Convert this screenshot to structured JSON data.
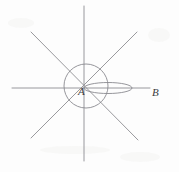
{
  "figure": {
    "background_color": "#fdfdfd",
    "line_color": "#8d8d92",
    "label_color": "#3b3b40",
    "width": 179,
    "height": 172,
    "labels": [
      {
        "id": "point-a",
        "text": "A",
        "x": 78,
        "y": 95
      },
      {
        "id": "point-b",
        "text": "B",
        "x": 152,
        "y": 96
      }
    ],
    "lines": [
      {
        "id": "horizontal-axis",
        "name": "horizontal-line",
        "x1": 12,
        "y1": 88,
        "x2": 150,
        "y2": 88
      },
      {
        "id": "vertical-axis",
        "name": "vertical-line",
        "x1": 84,
        "y1": 6,
        "x2": 84,
        "y2": 161
      },
      {
        "id": "diagonal-down-right",
        "name": "diagonal-line-nw-se",
        "x1": 31,
        "y1": 32,
        "x2": 138,
        "y2": 140
      },
      {
        "id": "diagonal-up-right",
        "name": "diagonal-line-sw-ne",
        "x1": 31,
        "y1": 138,
        "x2": 137,
        "y2": 32
      }
    ],
    "circle": {
      "id": "center-circle",
      "cx": 86,
      "cy": 86,
      "r": 22
    },
    "ellipse": {
      "id": "lens-ellipse",
      "cx": 108,
      "cy": 88,
      "rx": 24,
      "ry": 5.5
    }
  }
}
